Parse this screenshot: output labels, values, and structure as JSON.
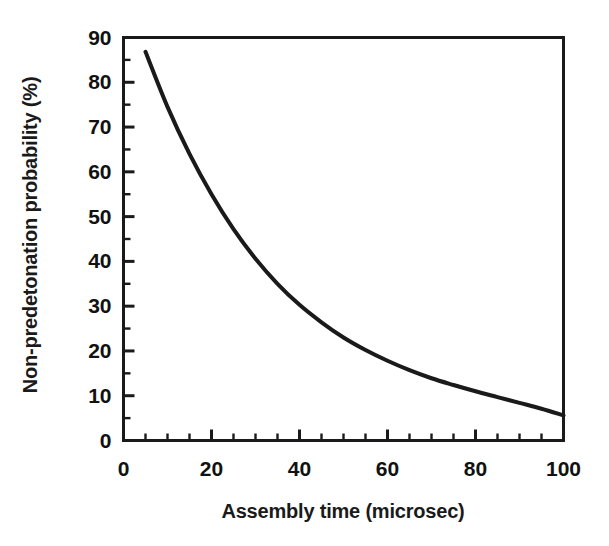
{
  "chart_data": {
    "type": "line",
    "title": "",
    "subtitle": "",
    "xlabel": "Assembly time (microsec)",
    "ylabel": "Non-predetonation probability (%)",
    "xlim": [
      0,
      100
    ],
    "ylim": [
      0,
      90
    ],
    "grid": false,
    "legend": null,
    "legend_position": "none",
    "x_major_ticks": [
      0,
      20,
      40,
      60,
      80,
      100
    ],
    "x_major_tick_labels": [
      "0",
      "20",
      "40",
      "60",
      "80",
      "100"
    ],
    "x_minor_tick_step": 5,
    "y_major_ticks": [
      0,
      10,
      20,
      30,
      40,
      50,
      60,
      70,
      80,
      90
    ],
    "y_major_tick_labels": [
      "0",
      "10",
      "20",
      "30",
      "40",
      "50",
      "60",
      "70",
      "80",
      "90"
    ],
    "y_minor_tick_step": 5,
    "series": [
      {
        "name": "Non-predetonation probability",
        "color": "#1a1a1a",
        "line_width": 4,
        "x": [
          5,
          10,
          15,
          20,
          25,
          30,
          35,
          40,
          45,
          50,
          55,
          60,
          65,
          70,
          75,
          80,
          85,
          90,
          95,
          100
        ],
        "y": [
          86.8,
          74.5,
          64.0,
          55.0,
          47.2,
          40.6,
          35.0,
          30.3,
          26.4,
          23.0,
          20.2,
          17.8,
          15.7,
          13.9,
          12.4,
          11.0,
          9.7,
          8.4,
          7.1,
          5.6
        ]
      }
    ]
  },
  "colors": {
    "axis": "#1a1a1a",
    "curve": "#1a1a1a",
    "background": "#ffffff",
    "text": "#111111"
  }
}
